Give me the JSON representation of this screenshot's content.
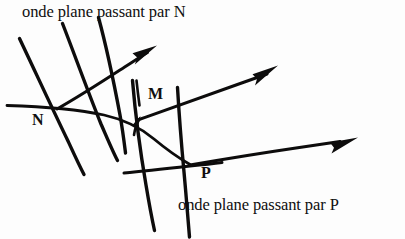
{
  "figure": {
    "title_top": "onde plane passant par N",
    "title_bottom": "onde plane passant par P",
    "point_labels": {
      "n": "N",
      "m": "M",
      "p": "P"
    },
    "colors": {
      "ink": "#0d0c0c",
      "paper": "#fdfdfd"
    },
    "elements": {
      "wavefronts_n_count": 3,
      "wavefronts_p_count": 2,
      "ray_arrows_count": 3,
      "curved_wavefront": "arc through N, M and P"
    }
  }
}
